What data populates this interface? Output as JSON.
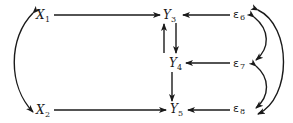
{
  "diagram": {
    "type": "path-diagram",
    "nodes": [
      {
        "id": "X1",
        "label": "X",
        "sub": "1",
        "kind": "exogenous"
      },
      {
        "id": "X2",
        "label": "X",
        "sub": "2",
        "kind": "exogenous"
      },
      {
        "id": "Y3",
        "label": "Y",
        "sub": "3",
        "kind": "endogenous"
      },
      {
        "id": "Y4",
        "label": "Y",
        "sub": "4",
        "kind": "endogenous"
      },
      {
        "id": "Y5",
        "label": "Y",
        "sub": "5",
        "kind": "endogenous"
      },
      {
        "id": "e6",
        "label": "ε",
        "sub": "6",
        "kind": "error"
      },
      {
        "id": "e7",
        "label": "ε",
        "sub": "7",
        "kind": "error"
      },
      {
        "id": "e8",
        "label": "ε",
        "sub": "8",
        "kind": "error"
      }
    ],
    "edges": [
      {
        "from": "X1",
        "to": "Y3",
        "type": "directed"
      },
      {
        "from": "X2",
        "to": "Y5",
        "type": "directed"
      },
      {
        "from": "e6",
        "to": "Y3",
        "type": "directed"
      },
      {
        "from": "e7",
        "to": "Y4",
        "type": "directed"
      },
      {
        "from": "e8",
        "to": "Y5",
        "type": "directed"
      },
      {
        "from": "Y3",
        "to": "Y4",
        "type": "directed"
      },
      {
        "from": "Y4",
        "to": "Y3",
        "type": "directed"
      },
      {
        "from": "Y4",
        "to": "Y5",
        "type": "directed"
      },
      {
        "from": "X1",
        "to": "X2",
        "type": "bidirected-curved"
      },
      {
        "from": "e6",
        "to": "e7",
        "type": "bidirected-curved"
      },
      {
        "from": "e7",
        "to": "e8",
        "type": "bidirected-curved"
      },
      {
        "from": "e6",
        "to": "e8",
        "type": "bidirected-curved"
      }
    ]
  },
  "labels": {
    "X1": {
      "main": "X",
      "sub": "1"
    },
    "X2": {
      "main": "X",
      "sub": "2"
    },
    "Y3": {
      "main": "Y",
      "sub": "3"
    },
    "Y4": {
      "main": "Y",
      "sub": "4"
    },
    "Y5": {
      "main": "Y",
      "sub": "5"
    },
    "e6": {
      "main": "ε",
      "sub": "6"
    },
    "e7": {
      "main": "ε",
      "sub": "7"
    },
    "e8": {
      "main": "ε",
      "sub": "8"
    }
  }
}
